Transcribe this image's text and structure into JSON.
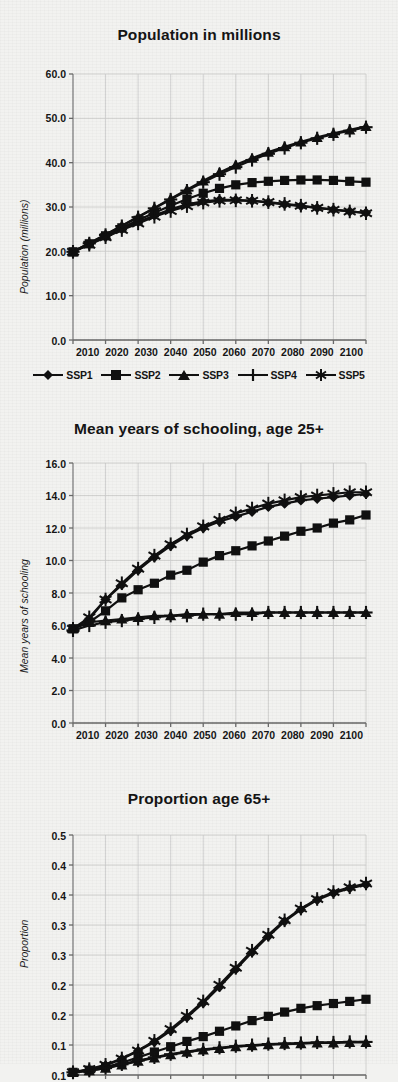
{
  "figure": {
    "background_color": "#f2f2f1",
    "ink_color": "#101010",
    "grid_color": "#c9c9c9"
  },
  "legend": {
    "position": "below-first-chart",
    "items": [
      {
        "label": "SSP1",
        "marker": "diamond"
      },
      {
        "label": "SSP2",
        "marker": "square"
      },
      {
        "label": "SSP3",
        "marker": "triangle"
      },
      {
        "label": "SSP4",
        "marker": "plus"
      },
      {
        "label": "SSP5",
        "marker": "asterisk"
      }
    ]
  },
  "chart_data": [
    {
      "type": "line",
      "title": "Population in millions",
      "xlabel": "",
      "ylabel": "Population (millions)",
      "x": [
        2010,
        2015,
        2020,
        2025,
        2030,
        2035,
        2040,
        2045,
        2050,
        2055,
        2060,
        2065,
        2070,
        2075,
        2080,
        2085,
        2090,
        2095,
        2100
      ],
      "xlim": [
        2010,
        2100
      ],
      "ylim": [
        0.0,
        60.0
      ],
      "xticks": [
        "2010",
        "2020",
        "2030",
        "2040",
        "2050",
        "2060",
        "2070",
        "2080",
        "2090",
        "2100"
      ],
      "yticks": [
        "0.0",
        "10.0",
        "20.0",
        "30.0",
        "40.0",
        "50.0",
        "60.0"
      ],
      "grid": true,
      "series": [
        {
          "name": "SSP1",
          "marker": "diamond",
          "values": [
            19.9,
            21.6,
            23.3,
            25.0,
            26.6,
            28.1,
            29.5,
            30.6,
            31.3,
            31.6,
            31.6,
            31.4,
            31.0,
            30.6,
            30.2,
            29.8,
            29.4,
            29.0,
            28.7
          ]
        },
        {
          "name": "SSP2",
          "marker": "square",
          "values": [
            19.9,
            21.7,
            23.5,
            25.3,
            27.0,
            28.7,
            30.3,
            31.8,
            33.1,
            34.2,
            35.0,
            35.5,
            35.8,
            36.0,
            36.1,
            36.1,
            36.0,
            35.8,
            35.6
          ]
        },
        {
          "name": "SSP3",
          "marker": "triangle",
          "values": [
            19.9,
            21.8,
            23.8,
            25.8,
            27.8,
            29.8,
            31.9,
            33.9,
            35.9,
            37.8,
            39.5,
            41.0,
            42.4,
            43.6,
            44.7,
            45.7,
            46.6,
            47.4,
            48.2
          ]
        },
        {
          "name": "SSP4",
          "marker": "plus",
          "values": [
            19.9,
            21.8,
            23.7,
            25.7,
            27.7,
            29.7,
            31.7,
            33.7,
            35.6,
            37.4,
            39.0,
            40.6,
            42.0,
            43.3,
            44.5,
            45.5,
            46.4,
            47.2,
            48.0
          ]
        },
        {
          "name": "SSP5",
          "marker": "asterisk",
          "values": [
            19.9,
            21.5,
            23.2,
            24.8,
            26.3,
            27.8,
            29.1,
            30.2,
            31.0,
            31.4,
            31.5,
            31.4,
            31.1,
            30.7,
            30.3,
            29.8,
            29.4,
            29.0,
            28.6
          ]
        }
      ]
    },
    {
      "type": "line",
      "title": "Mean years of schooling, age 25+",
      "xlabel": "",
      "ylabel": "Mean years of schooling",
      "x": [
        2010,
        2015,
        2020,
        2025,
        2030,
        2035,
        2040,
        2045,
        2050,
        2055,
        2060,
        2065,
        2070,
        2075,
        2080,
        2085,
        2090,
        2095,
        2100
      ],
      "xlim": [
        2010,
        2100
      ],
      "ylim": [
        0.0,
        16.0
      ],
      "xticks": [
        "2010",
        "2020",
        "2030",
        "2040",
        "2050",
        "2060",
        "2070",
        "2080",
        "2090",
        "2100"
      ],
      "yticks": [
        "0.0",
        "2.0",
        "4.0",
        "6.0",
        "8.0",
        "10.0",
        "12.0",
        "14.0",
        "16.0"
      ],
      "grid": true,
      "series": [
        {
          "name": "SSP1",
          "marker": "diamond",
          "values": [
            5.8,
            6.4,
            7.6,
            8.5,
            9.4,
            10.2,
            10.9,
            11.5,
            12.0,
            12.4,
            12.7,
            13.0,
            13.3,
            13.5,
            13.7,
            13.8,
            13.9,
            14.0,
            14.1
          ]
        },
        {
          "name": "SSP2",
          "marker": "square",
          "values": [
            5.8,
            6.2,
            6.9,
            7.7,
            8.2,
            8.6,
            9.1,
            9.4,
            9.9,
            10.3,
            10.6,
            10.9,
            11.2,
            11.5,
            11.8,
            12.0,
            12.3,
            12.5,
            12.8
          ]
        },
        {
          "name": "SSP3",
          "marker": "triangle",
          "values": [
            5.8,
            6.2,
            6.3,
            6.4,
            6.5,
            6.6,
            6.6,
            6.7,
            6.7,
            6.7,
            6.8,
            6.8,
            6.8,
            6.8,
            6.8,
            6.8,
            6.8,
            6.8,
            6.8
          ]
        },
        {
          "name": "SSP4",
          "marker": "plus",
          "values": [
            5.7,
            6.0,
            6.2,
            6.3,
            6.4,
            6.5,
            6.6,
            6.6,
            6.7,
            6.7,
            6.7,
            6.7,
            6.8,
            6.8,
            6.8,
            6.8,
            6.8,
            6.8,
            6.8
          ]
        },
        {
          "name": "SSP5",
          "marker": "asterisk",
          "values": [
            5.8,
            6.5,
            7.6,
            8.6,
            9.5,
            10.3,
            11.0,
            11.6,
            12.1,
            12.5,
            12.9,
            13.2,
            13.5,
            13.7,
            13.9,
            14.0,
            14.1,
            14.2,
            14.2
          ]
        }
      ]
    },
    {
      "type": "line",
      "title": "Proportion age 65+",
      "xlabel": "",
      "ylabel": "Proportion",
      "x": [
        2010,
        2015,
        2020,
        2025,
        2030,
        2035,
        2040,
        2045,
        2050,
        2055,
        2060,
        2065,
        2070,
        2075,
        2080,
        2085,
        2090,
        2095,
        2100
      ],
      "xlim": [
        2010,
        2100
      ],
      "ylim": [
        0.05,
        0.5
      ],
      "xticks": [
        "2010",
        "2020",
        "2030",
        "2040",
        "2050",
        "2060",
        "2070",
        "2080",
        "2090",
        "2100"
      ],
      "yticks": [
        "0.1",
        "0.1",
        "0.2",
        "0.2",
        "0.3",
        "0.3",
        "0.4",
        "0.4",
        "0.5"
      ],
      "grid": true,
      "series": [
        {
          "name": "SSP1",
          "marker": "diamond",
          "values": [
            0.055,
            0.06,
            0.068,
            0.08,
            0.095,
            0.112,
            0.133,
            0.158,
            0.185,
            0.215,
            0.248,
            0.28,
            0.31,
            0.338,
            0.36,
            0.378,
            0.391,
            0.4,
            0.407
          ]
        },
        {
          "name": "SSP2",
          "marker": "square",
          "values": [
            0.055,
            0.059,
            0.065,
            0.073,
            0.083,
            0.093,
            0.103,
            0.113,
            0.122,
            0.132,
            0.142,
            0.152,
            0.16,
            0.168,
            0.175,
            0.18,
            0.184,
            0.188,
            0.192
          ]
        },
        {
          "name": "SSP3",
          "marker": "triangle",
          "values": [
            0.055,
            0.058,
            0.063,
            0.069,
            0.076,
            0.082,
            0.088,
            0.093,
            0.097,
            0.1,
            0.103,
            0.105,
            0.107,
            0.108,
            0.109,
            0.11,
            0.11,
            0.111,
            0.111
          ]
        },
        {
          "name": "SSP4",
          "marker": "plus",
          "values": [
            0.055,
            0.058,
            0.063,
            0.07,
            0.077,
            0.083,
            0.089,
            0.094,
            0.098,
            0.101,
            0.104,
            0.106,
            0.108,
            0.109,
            0.11,
            0.111,
            0.111,
            0.112,
            0.112
          ]
        },
        {
          "name": "SSP5",
          "marker": "asterisk",
          "values": [
            0.055,
            0.061,
            0.069,
            0.081,
            0.096,
            0.114,
            0.136,
            0.161,
            0.188,
            0.219,
            0.251,
            0.283,
            0.313,
            0.34,
            0.362,
            0.38,
            0.393,
            0.402,
            0.409
          ]
        }
      ]
    }
  ]
}
